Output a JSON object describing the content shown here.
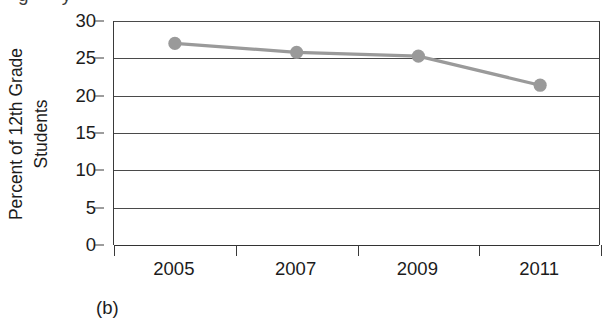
{
  "figure": {
    "caption": "(b)",
    "clipped_title_fragment": "g  y"
  },
  "chart_data": {
    "type": "line",
    "title": "",
    "xlabel": "",
    "ylabel": "Percent of 12th Grade Students",
    "ylabel_lines": [
      "Percent of 12th Grade",
      "Students"
    ],
    "categories": [
      "2005",
      "2007",
      "2009",
      "2011"
    ],
    "x": [
      2005,
      2007,
      2009,
      2011
    ],
    "values": [
      27.0,
      25.8,
      25.3,
      21.4
    ],
    "series": [
      {
        "name": "Percent of 12th grade students",
        "values": [
          27.0,
          25.8,
          25.3,
          21.4
        ]
      }
    ],
    "yticks": [
      0,
      5,
      10,
      15,
      20,
      25,
      30
    ],
    "ytick_labels": [
      "0",
      "5",
      "10",
      "15",
      "20",
      "25",
      "30"
    ],
    "ylim": [
      0,
      30
    ],
    "grid": "horizontal",
    "legend": "none",
    "marker": "circle",
    "colors": {
      "line": "#9a9a9a",
      "marker": "#9a9a9a",
      "axis": "#3a3a3a",
      "grid": "#4a4a4a",
      "text": "#1c1c1c",
      "background": "#ffffff"
    }
  }
}
